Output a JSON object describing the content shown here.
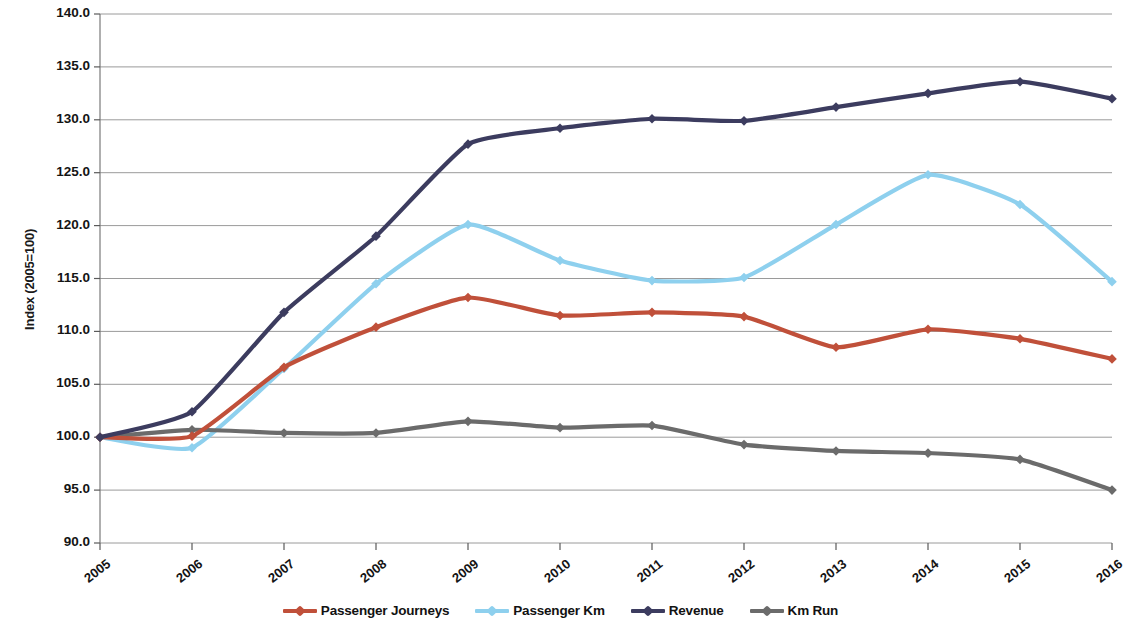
{
  "chart_data": {
    "type": "line",
    "title": "",
    "subtitle": "",
    "xlabel": "",
    "ylabel": "Index (2005=100)",
    "categories": [
      "2005",
      "2006",
      "2007",
      "2008",
      "2009",
      "2010",
      "2011",
      "2012",
      "2013",
      "2014",
      "2015",
      "2016"
    ],
    "x": [
      2005,
      2006,
      2007,
      2008,
      2009,
      2010,
      2011,
      2012,
      2013,
      2014,
      2015,
      2016
    ],
    "ylim": [
      90.0,
      140.0
    ],
    "ytick_values": [
      90.0,
      95.0,
      100.0,
      105.0,
      110.0,
      115.0,
      120.0,
      125.0,
      130.0,
      135.0,
      140.0
    ],
    "ytick_labels": [
      "90.0",
      "95.0",
      "100.0",
      "105.0",
      "110.0",
      "115.0",
      "120.0",
      "125.0",
      "130.0",
      "135.0",
      "140.0"
    ],
    "ytick_step": 5.0,
    "grid": "horizontal",
    "legend_position": "bottom",
    "markers": "diamond",
    "series": [
      {
        "name": "Passenger Journeys",
        "color": "#c0503a",
        "values": [
          100.0,
          100.1,
          106.6,
          110.4,
          113.2,
          111.5,
          111.8,
          111.4,
          108.5,
          110.2,
          109.3,
          107.4
        ]
      },
      {
        "name": "Passenger Km",
        "color": "#8ed0ee",
        "values": [
          100.0,
          99.0,
          106.5,
          114.5,
          120.1,
          116.7,
          114.8,
          115.1,
          120.1,
          124.8,
          122.0,
          114.7
        ]
      },
      {
        "name": "Revenue",
        "color": "#3c3c5f",
        "values": [
          100.0,
          102.4,
          111.8,
          119.0,
          127.7,
          129.2,
          130.1,
          129.9,
          131.2,
          132.5,
          133.6,
          132.0
        ]
      },
      {
        "name": "Km Run",
        "color": "#6b6b6b",
        "values": [
          100.0,
          100.7,
          100.4,
          100.4,
          101.5,
          100.9,
          101.1,
          99.3,
          98.7,
          98.5,
          97.9,
          95.0
        ]
      }
    ],
    "legend": [
      {
        "label": "Passenger Journeys",
        "color": "#c0503a"
      },
      {
        "label": "Passenger Km",
        "color": "#8ed0ee"
      },
      {
        "label": "Revenue",
        "color": "#3c3c5f"
      },
      {
        "label": "Km Run",
        "color": "#6b6b6b"
      }
    ]
  }
}
